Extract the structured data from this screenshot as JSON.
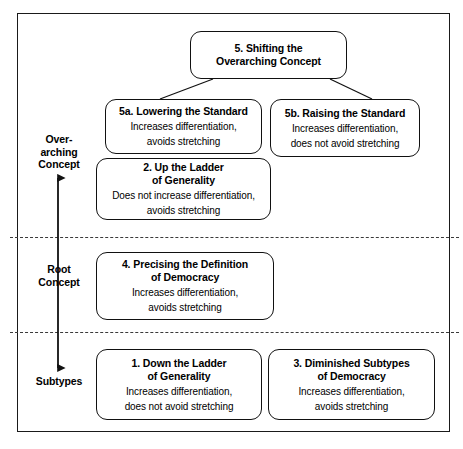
{
  "figure": {
    "type": "hierarchy-diagram",
    "frame_color": "#1a1a1a",
    "box_border_color": "#111111",
    "background": "#ffffff"
  },
  "bands": [
    {
      "id": "overarching",
      "label": "Over-\narching\nConcept",
      "label_line1": "Over-",
      "label_line2": "arching",
      "label_line3": "Concept"
    },
    {
      "id": "root",
      "label_line1": "Root",
      "label_line2": "Concept"
    },
    {
      "id": "subtypes",
      "label_line1": "Subtypes",
      "label_line2": ""
    }
  ],
  "nodes": {
    "n5": {
      "title_line1": "5. Shifting the",
      "title_line2": "Overarching Concept",
      "sub_line1": "",
      "sub_line2": ""
    },
    "n5a": {
      "title_line1": "5a. Lowering the Standard",
      "title_line2": "",
      "sub_line1": "Increases differentiation,",
      "sub_line2": "avoids stretching"
    },
    "n5b": {
      "title_line1": "5b. Raising the Standard",
      "title_line2": "",
      "sub_line1": "Increases differentiation,",
      "sub_line2": "does not avoid stretching"
    },
    "n2": {
      "title_line1": "2. Up the Ladder",
      "title_line2": "of Generality",
      "sub_line1": "Does not increase differentiation,",
      "sub_line2": "avoids stretching"
    },
    "n4": {
      "title_line1": "4. Precising the Definition",
      "title_line2": "of Democracy",
      "sub_line1": "Increases differentiation,",
      "sub_line2": "avoids stretching"
    },
    "n1": {
      "title_line1": "1. Down the Ladder",
      "title_line2": "of Generality",
      "sub_line1": "Increases differentiation,",
      "sub_line2": "does not avoid stretching"
    },
    "n3": {
      "title_line1": "3. Diminished Subtypes",
      "title_line2": "of Democracy",
      "sub_line1": "Increases differentiation,",
      "sub_line2": "avoids stretching"
    }
  },
  "connectors": [
    {
      "from": "n5",
      "to": "n5a"
    },
    {
      "from": "n5",
      "to": "n5b"
    }
  ],
  "axis": {
    "name": "abstraction-axis",
    "direction": "double-headed-vertical",
    "top_label": "Over-arching Concept",
    "bottom_label": "Subtypes"
  }
}
